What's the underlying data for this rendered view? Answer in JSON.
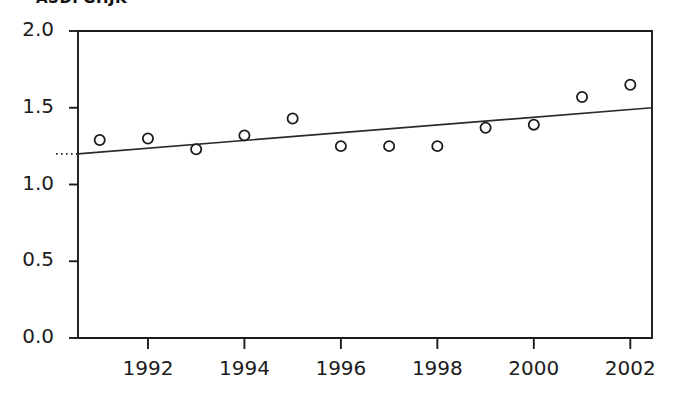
{
  "chart_data": {
    "type": "scatter",
    "title": "ASDFGHJK",
    "title_note": "title glyphs clipped by top image edge",
    "xlabel": "",
    "ylabel": "",
    "x": [
      1991,
      1992,
      1993,
      1994,
      1995,
      1996,
      1997,
      1998,
      1999,
      2000,
      2001,
      2002
    ],
    "values": [
      1.29,
      1.3,
      1.23,
      1.32,
      1.43,
      1.25,
      1.25,
      1.25,
      1.37,
      1.39,
      1.57,
      1.65
    ],
    "series": [
      {
        "name": "observations",
        "marker": "open-circle",
        "values": [
          1.29,
          1.3,
          1.23,
          1.32,
          1.43,
          1.25,
          1.25,
          1.25,
          1.37,
          1.39,
          1.57,
          1.65
        ]
      },
      {
        "name": "trend-line",
        "type": "line",
        "x_endpoints": [
          1990.55,
          2002.45
        ],
        "y_endpoints": [
          1.2,
          1.5
        ]
      }
    ],
    "reference_line": {
      "style": "dotted",
      "y": 1.2,
      "note": "dotted stub extending left of the y-axis at the trend line intercept"
    },
    "xlim": [
      1990.55,
      2002.45
    ],
    "ylim": [
      0.0,
      2.0
    ],
    "xticks": [
      1992,
      1994,
      1996,
      1998,
      2000,
      2002
    ],
    "xticklabels": [
      "1992",
      "1994",
      "1996",
      "1998",
      "2000",
      "2002"
    ],
    "yticks": [
      0.0,
      0.5,
      1.0,
      1.5,
      2.0
    ],
    "yticklabels": [
      "0.0",
      "0.5",
      "1.0",
      "1.5",
      "2.0"
    ],
    "grid": false,
    "legend": null,
    "colors": {
      "axis": "#1c1c1c",
      "marker": "#1c1c1c",
      "trend": "#2a2a2a",
      "background": "#ffffff"
    }
  }
}
